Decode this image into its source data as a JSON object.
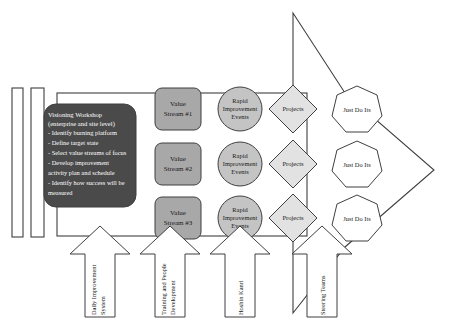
{
  "diagram": {
    "colors": {
      "outline": "#5a5a5a",
      "visioning_fill": "#4a4a4a",
      "visioning_text": "#ffffff",
      "value_stream_fill": "#a8a8a8",
      "rie_fill": "#c4c4c4",
      "projects_fill": "#e2e2e2",
      "just_do_it_fill": "#ffffff",
      "band_fill": "#ffffff",
      "bar_fill": "#ffffff",
      "big_arrow_fill": "#ffffff"
    },
    "left_bars": [
      {
        "name": "bar-1"
      },
      {
        "name": "bar-2"
      }
    ],
    "visioning": {
      "heading_line_1": "Visioning Workshop",
      "heading_line_2": "(enterprise and site level)",
      "bullets": [
        "- Identify burning platform",
        "- Define target state",
        "- Select value streams of focus",
        "- Develop improvement",
        "  activity plan and schedule",
        "- Identify how success will be",
        "  measured"
      ]
    },
    "value_streams": [
      {
        "line1": "Value",
        "line2": "Stream #1"
      },
      {
        "line1": "Value",
        "line2": "Stream #2"
      },
      {
        "line1": "Value",
        "line2": "Stream #3"
      }
    ],
    "rapid_improvement_events": [
      {
        "line1": "Rapid",
        "line2": "Improvement",
        "line3": "Events"
      },
      {
        "line1": "Rapid",
        "line2": "Improvement",
        "line3": "Events"
      },
      {
        "line1": "Rapid",
        "line2": "Improvement",
        "line3": "Events"
      }
    ],
    "projects": [
      {
        "label": "Projects"
      },
      {
        "label": "Projects"
      },
      {
        "label": "Projects"
      }
    ],
    "just_do_its": [
      {
        "label": "Just Do Its"
      },
      {
        "label": "Just Do Its"
      },
      {
        "label": "Just Do Its"
      }
    ],
    "enabler_arrows": [
      {
        "line1": "Daily Improvement",
        "line2": "System"
      },
      {
        "line1": "Training and People",
        "line2": "Development"
      },
      {
        "line1": "Hoshin Kanri",
        "line2": ""
      },
      {
        "line1": "Steering Teams",
        "line2": ""
      }
    ]
  }
}
